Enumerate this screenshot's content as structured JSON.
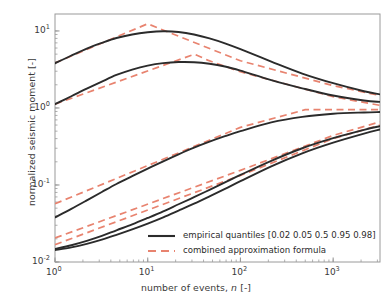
{
  "chart_data": {
    "type": "line",
    "title": "",
    "xlabel": "number of events, n [-]",
    "xlabel_plain": "number of events,",
    "xlabel_italic": "n",
    "xlabel_unit": "[-]",
    "ylabel": "normalized seismic moment [-]",
    "xscale": "log",
    "yscale": "log",
    "xlim": [
      1,
      3200
    ],
    "ylim": [
      0.01,
      16.6
    ],
    "grid": false,
    "legend_position": "lower right",
    "xticks": [
      {
        "value": 1,
        "mantissa": "10",
        "exponent": "0"
      },
      {
        "value": 10,
        "mantissa": "10",
        "exponent": "1"
      },
      {
        "value": 100,
        "mantissa": "10",
        "exponent": "2"
      },
      {
        "value": 1000,
        "mantissa": "10",
        "exponent": "3"
      }
    ],
    "yticks": [
      {
        "value": 10,
        "mantissa": "10",
        "exponent": "1"
      },
      {
        "value": 1,
        "mantissa": "10",
        "exponent": "0"
      },
      {
        "value": 0.1,
        "mantissa": "10",
        "exponent": "-1"
      },
      {
        "value": 0.01,
        "mantissa": "10",
        "exponent": "-2"
      }
    ],
    "colors": {
      "empirical": "#2b2b2b",
      "approximation": "#e8836f",
      "axis": "#9a9a9a",
      "text": "#3a3a3a",
      "background": "#ffffff"
    },
    "series": [
      {
        "name": "empirical quantiles 0.98",
        "style": "solid",
        "color": "#2b2b2b",
        "x": [
          1,
          1.5,
          2.2,
          3.2,
          4.6,
          6.8,
          10,
          14.7,
          21.5,
          31.6,
          46.4,
          68.1,
          100,
          215,
          464,
          1000,
          2150,
          3200
        ],
        "y": [
          3.8,
          4.8,
          5.9,
          7.0,
          8.1,
          9.0,
          9.6,
          9.9,
          9.7,
          9.0,
          8.0,
          6.9,
          5.8,
          4.0,
          2.8,
          2.1,
          1.65,
          1.5
        ]
      },
      {
        "name": "empirical quantiles 0.95",
        "style": "solid",
        "color": "#2b2b2b",
        "x": [
          1,
          1.5,
          2.2,
          3.2,
          4.6,
          6.8,
          10,
          14.7,
          21.5,
          31.6,
          46.4,
          68.1,
          100,
          215,
          464,
          1000,
          2150,
          3200
        ],
        "y": [
          1.12,
          1.42,
          1.78,
          2.2,
          2.68,
          3.15,
          3.55,
          3.82,
          3.95,
          3.93,
          3.75,
          3.45,
          3.05,
          2.3,
          1.8,
          1.45,
          1.25,
          1.2
        ]
      },
      {
        "name": "empirical quantiles 0.5",
        "style": "solid",
        "color": "#2b2b2b",
        "x": [
          1,
          1.5,
          2.2,
          3.2,
          4.6,
          6.8,
          10,
          14.7,
          21.5,
          31.6,
          46.4,
          68.1,
          100,
          215,
          464,
          1000,
          2150,
          3200
        ],
        "y": [
          0.038,
          0.049,
          0.063,
          0.081,
          0.103,
          0.13,
          0.163,
          0.203,
          0.25,
          0.305,
          0.365,
          0.43,
          0.5,
          0.65,
          0.765,
          0.84,
          0.875,
          0.885
        ]
      },
      {
        "name": "empirical quantiles 0.05",
        "style": "solid",
        "color": "#2b2b2b",
        "x": [
          1,
          1.5,
          2.2,
          3.2,
          4.6,
          6.8,
          10,
          14.7,
          21.5,
          31.6,
          46.4,
          68.1,
          100,
          215,
          464,
          1000,
          2150,
          3200
        ],
        "y": [
          0.0148,
          0.0165,
          0.0188,
          0.0218,
          0.0258,
          0.0308,
          0.0373,
          0.0455,
          0.0562,
          0.0695,
          0.0865,
          0.108,
          0.135,
          0.206,
          0.3,
          0.405,
          0.52,
          0.58
        ]
      },
      {
        "name": "empirical quantiles 0.02",
        "style": "solid",
        "color": "#2b2b2b",
        "x": [
          1,
          1.5,
          2.2,
          3.2,
          4.6,
          6.8,
          10,
          14.7,
          21.5,
          31.6,
          46.4,
          68.1,
          100,
          215,
          464,
          1000,
          2150,
          3200
        ],
        "y": [
          0.0143,
          0.0155,
          0.0172,
          0.0195,
          0.0225,
          0.0265,
          0.0315,
          0.038,
          0.0465,
          0.0572,
          0.0712,
          0.089,
          0.112,
          0.175,
          0.258,
          0.355,
          0.465,
          0.525
        ]
      },
      {
        "name": "combined approximation formula 0.98",
        "style": "dashed",
        "color": "#e8836f",
        "x": [
          1,
          10,
          18,
          100,
          1000,
          3200
        ],
        "y": [
          3.85,
          12.4,
          9.3,
          4.1,
          1.95,
          1.45
        ]
      },
      {
        "name": "combined approximation formula 0.95",
        "style": "dashed",
        "color": "#e8836f",
        "x": [
          1,
          32,
          45,
          100,
          1000,
          3200
        ],
        "y": [
          1.12,
          5.0,
          4.15,
          2.95,
          1.4,
          1.08
        ]
      },
      {
        "name": "combined approximation formula 0.5",
        "style": "dashed",
        "color": "#e8836f",
        "x": [
          1,
          100,
          500,
          3200
        ],
        "y": [
          0.057,
          0.56,
          0.95,
          0.95
        ]
      },
      {
        "name": "combined approximation formula 0.05",
        "style": "dashed",
        "color": "#e8836f",
        "x": [
          1,
          100,
          1000,
          3200
        ],
        "y": [
          0.0205,
          0.155,
          0.44,
          0.66
        ]
      },
      {
        "name": "combined approximation formula 0.02",
        "style": "dashed",
        "color": "#e8836f",
        "x": [
          1,
          100,
          1000,
          3200
        ],
        "y": [
          0.0168,
          0.133,
          0.4,
          0.6
        ]
      }
    ],
    "legend": [
      {
        "label": "empirical quantiles [0.02 0.05 0.5  0.95 0.98]",
        "style": "solid",
        "color": "#2b2b2b"
      },
      {
        "label": "combined approximation formula",
        "style": "dashed",
        "color": "#e8836f"
      }
    ]
  }
}
